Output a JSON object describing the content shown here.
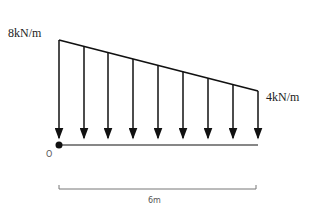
{
  "diagram": {
    "type": "linearly varying distributed load on beam",
    "load_left_label": "8kN/m",
    "load_right_label": "4kN/m",
    "origin_label": "O",
    "span_label": "6m",
    "load_left_value": 8,
    "load_right_value": 4,
    "span_m": 6,
    "arrow_count": 9,
    "colors": {
      "line": "#111111",
      "dimension": "#777777"
    }
  }
}
